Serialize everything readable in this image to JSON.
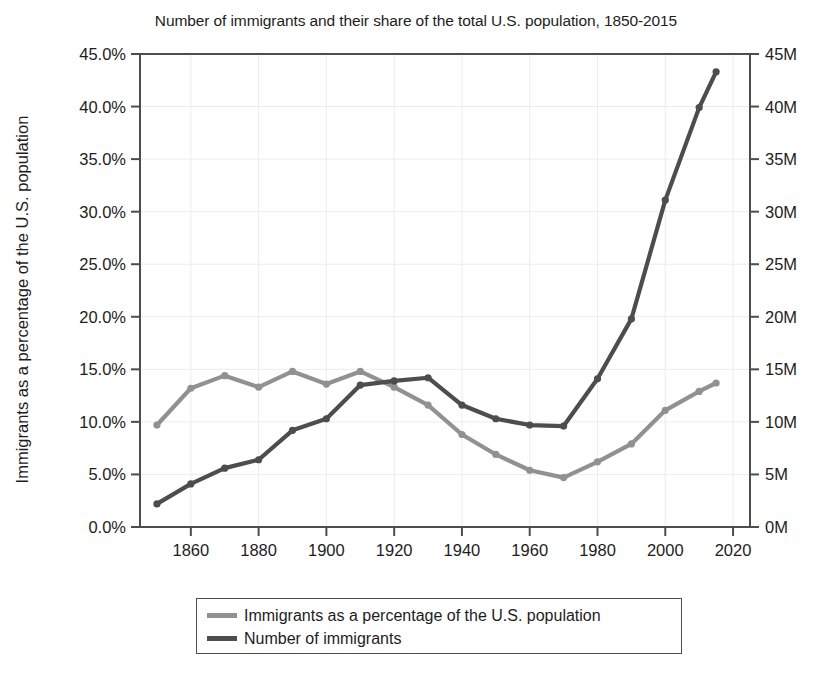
{
  "chart_data": {
    "type": "line",
    "title": "Number of immigrants and their share of the total U.S. population, 1850-2015",
    "xlabel": "",
    "ylabel": "Immigrants as a percentage of the U.S. population",
    "y2label": "",
    "grid": true,
    "legend_position": "bottom",
    "xlim": [
      1845,
      2025
    ],
    "ylim": [
      0,
      45
    ],
    "y2lim": [
      0,
      45
    ],
    "x_ticks": [
      1860,
      1880,
      1900,
      1920,
      1940,
      1960,
      1980,
      2000,
      2020
    ],
    "x_tick_labels": [
      "1860",
      "1880",
      "1900",
      "1920",
      "1940",
      "1960",
      "1980",
      "2000",
      "2020"
    ],
    "y_ticks": [
      0,
      5,
      10,
      15,
      20,
      25,
      30,
      35,
      40,
      45
    ],
    "y_tick_labels": [
      "0.0%",
      "5.0%",
      "10.0%",
      "15.0%",
      "20.0%",
      "25.0%",
      "30.0%",
      "35.0%",
      "40.0%",
      "45.0%"
    ],
    "y2_ticks": [
      0,
      5,
      10,
      15,
      20,
      25,
      30,
      35,
      40,
      45
    ],
    "y2_tick_labels": [
      "0M",
      "5M",
      "10M",
      "15M",
      "20M",
      "25M",
      "30M",
      "35M",
      "40M",
      "45M"
    ],
    "x": [
      1850,
      1860,
      1870,
      1880,
      1890,
      1900,
      1910,
      1920,
      1930,
      1940,
      1950,
      1960,
      1970,
      1980,
      1990,
      2000,
      2010,
      2015
    ],
    "series": [
      {
        "name": "Immigrants as a percentage of the U.S. population",
        "axis": "left",
        "unit": "%",
        "color": "#919191",
        "values": [
          9.7,
          13.2,
          14.4,
          13.3,
          14.8,
          13.6,
          14.8,
          13.3,
          11.6,
          8.8,
          6.9,
          5.4,
          4.7,
          6.2,
          7.9,
          11.1,
          12.9,
          13.7
        ]
      },
      {
        "name": "Number of immigrants",
        "axis": "right",
        "unit": "M",
        "color": "#4d4d4d",
        "values": [
          2.2,
          4.1,
          5.6,
          6.4,
          9.2,
          10.3,
          13.5,
          13.9,
          14.2,
          11.6,
          10.3,
          9.7,
          9.6,
          14.1,
          19.8,
          31.1,
          39.9,
          43.3
        ]
      }
    ]
  },
  "legend": {
    "items": [
      {
        "label": "Immigrants as a percentage of the U.S. population",
        "color": "#919191"
      },
      {
        "label": "Number of immigrants",
        "color": "#4d4d4d"
      }
    ]
  }
}
